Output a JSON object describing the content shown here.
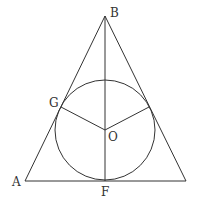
{
  "diagram": {
    "type": "triangle with inscribed circle",
    "labels": {
      "B": "B",
      "G": "G",
      "O": "O",
      "A": "A",
      "F": "F"
    },
    "points": {
      "B": [
        105,
        16
      ],
      "A": [
        25,
        181
      ],
      "C": [
        186,
        181
      ],
      "F": [
        105,
        181
      ],
      "O": [
        105,
        130
      ],
      "G": [
        61,
        107
      ],
      "H": [
        149,
        107
      ]
    },
    "circle": {
      "center": [
        105,
        130
      ],
      "r": 50
    },
    "stroke": "#333333"
  }
}
